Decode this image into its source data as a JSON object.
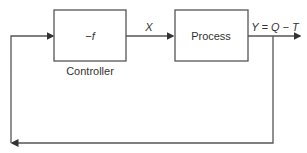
{
  "diagram": {
    "type": "feedback-control-loop",
    "blocks": [
      {
        "id": "controller",
        "inner_label": "−f",
        "caption": "Controller"
      },
      {
        "id": "process",
        "inner_label": "Process"
      }
    ],
    "signals": {
      "controller_to_process": "X",
      "output": "Y = Q − T"
    },
    "colors": {
      "stroke": "#555555",
      "text": "#333333",
      "background": "#ffffff"
    }
  }
}
